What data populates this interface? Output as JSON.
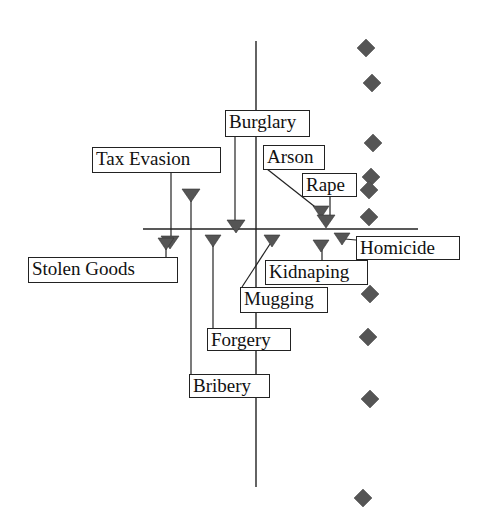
{
  "diagram": {
    "type": "scatter-with-callouts",
    "colors": {
      "marker": "#555555",
      "line": "#222222",
      "background": "#ffffff"
    },
    "axes": {
      "vertical": {
        "x": 256,
        "y1": 41,
        "y2": 487
      },
      "horizontal": {
        "y": 229,
        "x1": 143,
        "x2": 418
      }
    },
    "labels": [
      {
        "id": "burglary",
        "text": "Burglary"
      },
      {
        "id": "tax_evasion",
        "text": "Tax Evasion"
      },
      {
        "id": "arson",
        "text": "Arson"
      },
      {
        "id": "rape",
        "text": "Rape"
      },
      {
        "id": "homicide",
        "text": "Homicide"
      },
      {
        "id": "stolen_goods",
        "text": "Stolen Goods"
      },
      {
        "id": "kidnaping",
        "text": "Kidnaping"
      },
      {
        "id": "mugging",
        "text": "Mugging"
      },
      {
        "id": "forgery",
        "text": "Forgery"
      },
      {
        "id": "bribery",
        "text": "Bribery"
      }
    ],
    "triangle_markers": [
      {
        "label": "Tax Evasion",
        "x": 169,
        "y": 242
      },
      {
        "label": "Stolen Goods",
        "x": 166,
        "y": 244
      },
      {
        "label": "Bribery",
        "x": 191,
        "y": 195
      },
      {
        "label": "Burglary",
        "x": 236,
        "y": 226
      },
      {
        "label": "Forgery",
        "x": 213,
        "y": 241
      },
      {
        "label": "Mugging",
        "x": 272,
        "y": 241
      },
      {
        "label": "Arson",
        "x": 321,
        "y": 212
      },
      {
        "label": "Rape",
        "x": 326,
        "y": 221
      },
      {
        "label": "Kidnaping",
        "x": 321,
        "y": 246
      },
      {
        "label": "Homicide",
        "x": 342,
        "y": 239
      }
    ],
    "diamond_markers": [
      {
        "x": 366,
        "y": 48
      },
      {
        "x": 372,
        "y": 83
      },
      {
        "x": 373,
        "y": 143
      },
      {
        "x": 371,
        "y": 177
      },
      {
        "x": 369,
        "y": 190
      },
      {
        "x": 369,
        "y": 217
      },
      {
        "x": 370,
        "y": 294
      },
      {
        "x": 368,
        "y": 337
      },
      {
        "x": 370,
        "y": 399
      },
      {
        "x": 363,
        "y": 498
      }
    ]
  }
}
